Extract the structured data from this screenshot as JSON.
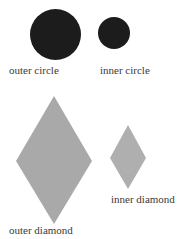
{
  "shapes": [
    {
      "id": "outer-circle",
      "type": "circle",
      "color": "#1c1c1c",
      "label": "outer circle"
    },
    {
      "id": "inner-circle",
      "type": "circle",
      "color": "#1c1c1c",
      "label": "inner circle"
    },
    {
      "id": "outer-diamond",
      "type": "diamond",
      "color": "#a9a9a9",
      "label": "outer diamond"
    },
    {
      "id": "inner-diamond",
      "type": "diamond",
      "color": "#afafaf",
      "label": "inner diamond"
    }
  ]
}
